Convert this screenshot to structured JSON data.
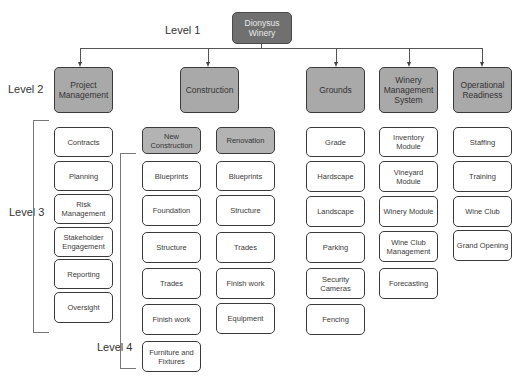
{
  "levels": {
    "level1": "Level 1",
    "level2": "Level 2",
    "level3": "Level 3",
    "level4": "Level 4"
  },
  "root": {
    "label": "Dionysus\nWinery"
  },
  "level2": [
    {
      "label": "Project Management"
    },
    {
      "label": "Construction"
    },
    {
      "label": "Grounds"
    },
    {
      "label": "Winery Management System"
    },
    {
      "label": "Operational Readiness"
    }
  ],
  "project_management": [
    "Contracts",
    "Planning",
    "Risk Management",
    "Stakeholder Engagement",
    "Reporting",
    "Oversight"
  ],
  "construction": {
    "new_construction": {
      "label": "New Construction",
      "items": [
        "Blueprints",
        "Foundation",
        "Structure",
        "Trades",
        "Finish work",
        "Furniture and Fixtures"
      ]
    },
    "renovation": {
      "label": "Renovation",
      "items": [
        "Blueprints",
        "Structure",
        "Trades",
        "Finish work",
        "Equipment"
      ]
    }
  },
  "grounds": [
    "Grade",
    "Hardscape",
    "Landscape",
    "Parking",
    "Security Cameras",
    "Fencing"
  ],
  "winery_management_system": [
    "Inventory Module",
    "Vineyard Module",
    "Winery Module",
    "Wine Club Management",
    "Forecasting"
  ],
  "operational_readiness": [
    "Staffing",
    "Training",
    "Wine Club",
    "Grand Opening"
  ],
  "colors": {
    "root_fill": "#707070",
    "level2_fill": "#a9a9a9",
    "subgroup_fill": "#b3b3b3",
    "leaf_fill": "#ffffff",
    "stroke": "#3a3a3a"
  }
}
